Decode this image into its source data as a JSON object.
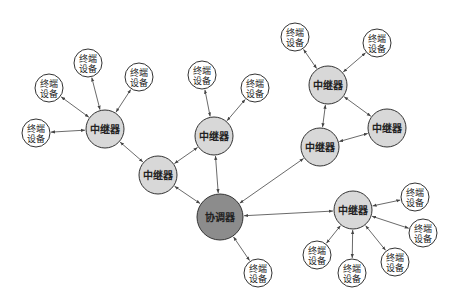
{
  "diagram": {
    "title": "",
    "colors": {
      "coordinator_fill": "#8c8c8c",
      "router_fill": "#d8d8d8",
      "end_device_fill": "#ffffff",
      "stroke": "#333333",
      "edge": "#444444"
    },
    "labels": {
      "coordinator": "协调器",
      "router": "中继器",
      "end_device_line1": "终端",
      "end_device_line2": "设备"
    },
    "nodes": [
      {
        "id": "C",
        "type": "coordinator",
        "x": 220,
        "y": 217,
        "r": 23
      },
      {
        "id": "R1",
        "type": "router",
        "x": 105,
        "y": 129,
        "r": 19
      },
      {
        "id": "R2",
        "type": "router",
        "x": 158,
        "y": 175,
        "r": 19
      },
      {
        "id": "R3",
        "type": "router",
        "x": 214,
        "y": 136,
        "r": 19
      },
      {
        "id": "R4",
        "type": "router",
        "x": 328,
        "y": 85,
        "r": 19
      },
      {
        "id": "R5",
        "type": "router",
        "x": 387,
        "y": 128,
        "r": 19
      },
      {
        "id": "R6",
        "type": "router",
        "x": 320,
        "y": 147,
        "r": 19
      },
      {
        "id": "R7",
        "type": "router",
        "x": 353,
        "y": 210,
        "r": 19
      },
      {
        "id": "E1",
        "type": "end_device",
        "x": 49,
        "y": 88,
        "r": 14
      },
      {
        "id": "E2",
        "type": "end_device",
        "x": 88,
        "y": 63,
        "r": 14
      },
      {
        "id": "E3",
        "type": "end_device",
        "x": 139,
        "y": 77,
        "r": 14
      },
      {
        "id": "E4",
        "type": "end_device",
        "x": 36,
        "y": 133,
        "r": 14
      },
      {
        "id": "E5",
        "type": "end_device",
        "x": 202,
        "y": 75,
        "r": 14
      },
      {
        "id": "E6",
        "type": "end_device",
        "x": 255,
        "y": 88,
        "r": 14
      },
      {
        "id": "E7",
        "type": "end_device",
        "x": 295,
        "y": 37,
        "r": 14
      },
      {
        "id": "E8",
        "type": "end_device",
        "x": 377,
        "y": 43,
        "r": 14
      },
      {
        "id": "E9",
        "type": "end_device",
        "x": 258,
        "y": 273,
        "r": 14
      },
      {
        "id": "E10",
        "type": "end_device",
        "x": 415,
        "y": 197,
        "r": 14
      },
      {
        "id": "E11",
        "type": "end_device",
        "x": 423,
        "y": 233,
        "r": 14
      },
      {
        "id": "E12",
        "type": "end_device",
        "x": 395,
        "y": 262,
        "r": 14
      },
      {
        "id": "E13",
        "type": "end_device",
        "x": 352,
        "y": 273,
        "r": 14
      },
      {
        "id": "E14",
        "type": "end_device",
        "x": 317,
        "y": 255,
        "r": 14
      }
    ],
    "edges": [
      [
        "R1",
        "E1"
      ],
      [
        "R1",
        "E2"
      ],
      [
        "R1",
        "E3"
      ],
      [
        "R1",
        "E4"
      ],
      [
        "R1",
        "R2"
      ],
      [
        "R2",
        "R3"
      ],
      [
        "R2",
        "C"
      ],
      [
        "R3",
        "E5"
      ],
      [
        "R3",
        "E6"
      ],
      [
        "R3",
        "C"
      ],
      [
        "R4",
        "E7"
      ],
      [
        "R4",
        "E8"
      ],
      [
        "R4",
        "R5"
      ],
      [
        "R4",
        "R6"
      ],
      [
        "R5",
        "R6"
      ],
      [
        "R6",
        "C"
      ],
      [
        "C",
        "E9"
      ],
      [
        "C",
        "R7"
      ],
      [
        "R7",
        "E10"
      ],
      [
        "R7",
        "E11"
      ],
      [
        "R7",
        "E12"
      ],
      [
        "R7",
        "E13"
      ],
      [
        "R7",
        "E14"
      ]
    ],
    "caption": ""
  }
}
